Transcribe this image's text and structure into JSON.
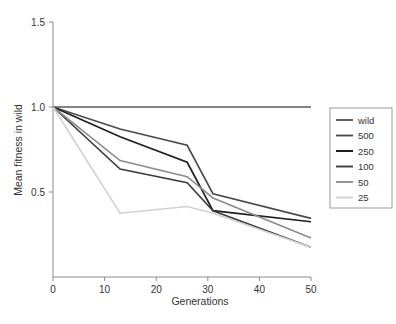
{
  "chart_data": {
    "type": "line",
    "title": "",
    "xlabel": "Generations",
    "ylabel": "Mean fitness in wild",
    "xlim": [
      0,
      50
    ],
    "ylim": [
      0,
      1.5
    ],
    "xticks": [
      0,
      10,
      20,
      30,
      40,
      50
    ],
    "xtick_labels": [
      "0",
      "10",
      "20",
      "30",
      "40",
      "50"
    ],
    "yticks": [
      0.5,
      1.0,
      1.5
    ],
    "ytick_labels": [
      "0.5",
      "1.0",
      "1.5"
    ],
    "grid": false,
    "legend_position": "right",
    "x": [
      0,
      13,
      26,
      31,
      50
    ],
    "series": [
      {
        "name": "wild",
        "color": "#5a5a5a",
        "width": 1.6,
        "values": [
          1.0,
          1.0,
          1.0,
          1.0,
          1.0
        ]
      },
      {
        "name": "500",
        "color": "#4a4a4a",
        "width": 1.6,
        "values": [
          1.0,
          0.87,
          0.775,
          0.49,
          0.345
        ]
      },
      {
        "name": "250",
        "color": "#1f1f1f",
        "width": 1.7,
        "values": [
          1.0,
          0.825,
          0.675,
          0.39,
          0.325
        ]
      },
      {
        "name": "100",
        "color": "#3c3c3c",
        "width": 1.6,
        "values": [
          1.0,
          0.635,
          0.555,
          0.39,
          0.175
        ]
      },
      {
        "name": "50",
        "color": "#8d8d8d",
        "width": 1.6,
        "values": [
          1.0,
          0.685,
          0.59,
          0.465,
          0.23
        ]
      },
      {
        "name": "25",
        "color": "#d2d2d2",
        "width": 1.6,
        "values": [
          1.0,
          0.375,
          0.415,
          0.375,
          0.175
        ]
      }
    ]
  },
  "legend": {
    "entries": [
      {
        "label": "wild"
      },
      {
        "label": "500"
      },
      {
        "label": "250"
      },
      {
        "label": "100"
      },
      {
        "label": "50"
      },
      {
        "label": "25"
      }
    ]
  }
}
